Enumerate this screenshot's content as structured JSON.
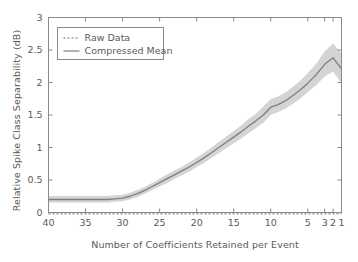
{
  "chart_data": {
    "type": "line",
    "title": "",
    "xlabel": "Number of Coefficients Retained per Event",
    "ylabel": "Relative Spike Class Separability (dB)",
    "xlim": [
      40,
      1
    ],
    "ylim": [
      0,
      3
    ],
    "x_reversed": true,
    "grid": false,
    "legend_position": "upper left",
    "xticks": [
      40,
      35,
      30,
      25,
      20,
      15,
      10,
      5,
      3,
      2,
      1
    ],
    "xticklabels": [
      "40",
      "35",
      "30",
      "25",
      "20",
      "15",
      "10",
      "5",
      "3",
      "2",
      "1"
    ],
    "yticks": [
      0,
      0.5,
      1,
      1.5,
      2,
      2.5,
      3
    ],
    "yticklabels": [
      "0",
      "0.5",
      "1",
      "1.5",
      "2",
      "2.5",
      "3"
    ],
    "x": [
      40,
      39,
      38,
      37,
      36,
      35,
      34,
      33,
      32,
      31,
      30,
      29,
      28,
      27,
      26,
      25,
      24,
      23,
      22,
      21,
      20,
      19,
      18,
      17,
      16,
      15,
      14,
      13,
      12,
      11,
      10,
      9,
      8,
      7,
      6,
      5,
      4,
      3,
      2,
      1
    ],
    "series": [
      {
        "name": "Compressed Mean",
        "style": "solid",
        "color": "#7f7f7f",
        "values": [
          0.2,
          0.2,
          0.2,
          0.2,
          0.2,
          0.2,
          0.2,
          0.2,
          0.2,
          0.21,
          0.22,
          0.25,
          0.29,
          0.34,
          0.4,
          0.46,
          0.52,
          0.58,
          0.64,
          0.7,
          0.77,
          0.84,
          0.92,
          1.0,
          1.08,
          1.16,
          1.24,
          1.33,
          1.41,
          1.5,
          1.62,
          1.66,
          1.72,
          1.8,
          1.89,
          1.99,
          2.12,
          2.28,
          2.38,
          2.21
        ],
        "band_color": "#cccccc",
        "band_lower": [
          0.155,
          0.155,
          0.155,
          0.155,
          0.155,
          0.155,
          0.155,
          0.155,
          0.155,
          0.165,
          0.175,
          0.2,
          0.24,
          0.29,
          0.345,
          0.4,
          0.455,
          0.515,
          0.575,
          0.63,
          0.7,
          0.765,
          0.84,
          0.915,
          0.99,
          1.065,
          1.14,
          1.22,
          1.3,
          1.38,
          1.5,
          1.545,
          1.6,
          1.675,
          1.755,
          1.85,
          1.96,
          2.09,
          2.17,
          1.99
        ],
        "band_upper": [
          0.255,
          0.255,
          0.255,
          0.255,
          0.255,
          0.255,
          0.255,
          0.255,
          0.255,
          0.265,
          0.275,
          0.305,
          0.345,
          0.395,
          0.455,
          0.52,
          0.585,
          0.645,
          0.705,
          0.77,
          0.845,
          0.92,
          1.0,
          1.085,
          1.17,
          1.255,
          1.34,
          1.44,
          1.52,
          1.63,
          1.745,
          1.785,
          1.85,
          1.935,
          2.03,
          2.145,
          2.29,
          2.48,
          2.6,
          2.45
        ]
      },
      {
        "name": "Raw Data",
        "style": "dotted",
        "color": "#6e6e6e",
        "constant_value": -0.02
      }
    ],
    "legend": [
      {
        "label": "Raw Data",
        "style": "dotted",
        "color": "#6e6e6e"
      },
      {
        "label": "Compressed Mean",
        "style": "solid",
        "color": "#7f7f7f"
      }
    ]
  },
  "figure": {
    "axis_color": "#8a8a8a",
    "text_color": "#5a5a5a",
    "background": "#ffffff"
  }
}
